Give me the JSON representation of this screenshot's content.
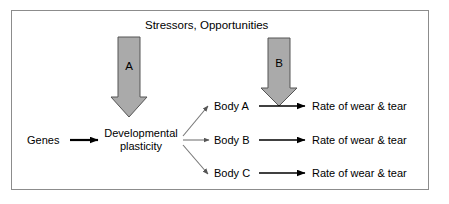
{
  "figure": {
    "title": "Stressors, Opportunities",
    "frame_color": "#8c8c8c",
    "background": "#ffffff"
  },
  "nodes": {
    "genes": "Genes",
    "plasticity": "Developmental plasticity",
    "bodies": [
      "Body A",
      "Body B",
      "Body C"
    ],
    "outcomes": [
      "Rate of wear & tear",
      "Rate of wear & tear",
      "Rate of wear & tear"
    ]
  },
  "block_arrows": [
    {
      "letter": "A",
      "fill": "#aaaaaa",
      "stroke": "#555555",
      "direction": "down"
    },
    {
      "letter": "B",
      "fill": "#aaaaaa",
      "stroke": "#555555",
      "direction": "down"
    }
  ],
  "connectors": {
    "genes_to_plasticity": {
      "style": "solid-black-arrow",
      "color": "#000000"
    },
    "plasticity_to_bodies": {
      "style": "thin-gray-arrow",
      "color": "#777777"
    },
    "bodies_to_outcomes": {
      "style": "solid-black-arrow",
      "color": "#000000"
    }
  }
}
